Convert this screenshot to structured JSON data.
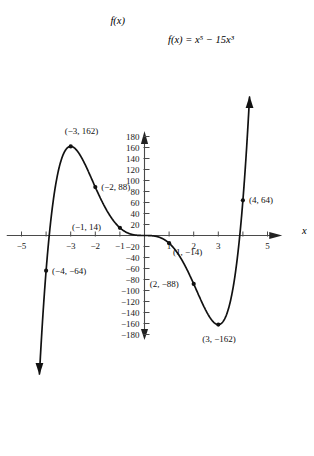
{
  "figure": {
    "equation_label": "f(x) = x⁵ − 15x³",
    "y_axis_name": "f(x)",
    "x_axis_name": "x"
  },
  "chart_data": {
    "type": "line",
    "title": "",
    "subtitle": "",
    "xlabel": "x",
    "ylabel": "f(x)",
    "annotation": "f(x) = x⁵ − 15x³",
    "function": "x^5 - 15x^3",
    "grid": false,
    "legend": "none",
    "xlim": [
      -5.6,
      5.6
    ],
    "ylim": [
      -190,
      190
    ],
    "x_ticks": [
      -5,
      -4,
      -3,
      -2,
      -1,
      1,
      2,
      3,
      4,
      5
    ],
    "x_tick_labels": [
      "−5",
      "",
      "−3",
      "−2",
      "−1",
      "1",
      "2",
      "3",
      "",
      "5"
    ],
    "y_ticks": [
      -180,
      -160,
      -140,
      -120,
      -100,
      -80,
      -60,
      -40,
      -20,
      20,
      40,
      60,
      80,
      100,
      120,
      140,
      160,
      180
    ],
    "y_tick_labels": [
      "−180",
      "−160",
      "−140",
      "−120",
      "−100",
      "−80",
      "−60",
      "−40",
      "−20",
      "20",
      "40",
      "60",
      "80",
      "100",
      "120",
      "140",
      "160",
      "180"
    ],
    "points": [
      {
        "label": "(−4, −64)",
        "x": -4,
        "y": -64,
        "label_dx": 6,
        "label_dy": 3
      },
      {
        "label": "(−3, 162)",
        "x": -3,
        "y": 162,
        "label_dx": -6,
        "label_dy": -12
      },
      {
        "label": "(−2, 88)",
        "x": -2,
        "y": 88,
        "label_dx": 6,
        "label_dy": 3
      },
      {
        "label": "(−1, 14)",
        "x": -1,
        "y": 14,
        "label_dx": -48,
        "label_dy": 2
      },
      {
        "label": "(1, −14)",
        "x": 1,
        "y": -14,
        "label_dx": 4,
        "label_dy": 12
      },
      {
        "label": "(2, −88)",
        "x": 2,
        "y": -88,
        "label_dx": -44,
        "label_dy": 3
      },
      {
        "label": "(3, −162)",
        "x": 3,
        "y": -162,
        "label_dx": -16,
        "label_dy": 17
      },
      {
        "label": "(4, 64)",
        "x": 4,
        "y": 64,
        "label_dx": 6,
        "label_dy": 3
      }
    ],
    "curve_domain": [
      -4.27,
      4.27
    ],
    "arrows": [
      "curve-end-bottom-left",
      "curve-end-top-right",
      "x-axis-right",
      "y-axis-up",
      "y-axis-down"
    ]
  }
}
